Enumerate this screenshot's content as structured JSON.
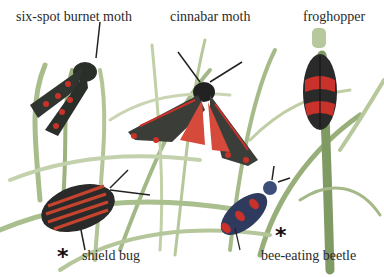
{
  "labels": {
    "burnet": "six-spot burnet moth",
    "cinnabar": "cinnabar moth",
    "froghopper": "froghopper",
    "shield": "shield bug",
    "beetle": "bee-eating beetle"
  },
  "markers": {
    "shield_star": "*",
    "beetle_star": "*"
  },
  "colors": {
    "grass_light": "#b8c99a",
    "grass_mid": "#8fa873",
    "grass_dark": "#6d8a55",
    "moth_body": "#2b2f2a",
    "spot_red": "#c8322a",
    "cinnabar_hind": "#d64a3c",
    "shield_stripe": "#c6442e",
    "beetle_blue": "#3e4e7a"
  }
}
